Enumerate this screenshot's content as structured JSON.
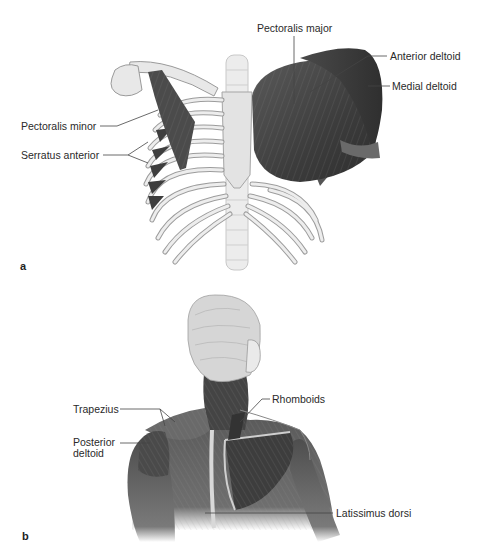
{
  "figure": {
    "panels": [
      {
        "id": "a",
        "letter": "a",
        "view": "anterior chest",
        "labels": {
          "pectoralis_major": "Pectoralis major",
          "anterior_deltoid": "Anterior deltoid",
          "medial_deltoid": "Medial deltoid",
          "pectoralis_minor": "Pectoralis minor",
          "serratus_anterior": "Serratus anterior"
        }
      },
      {
        "id": "b",
        "letter": "b",
        "view": "posterior upper back",
        "labels": {
          "trapezius": "Trapezius",
          "rhomboids": "Rhomboids",
          "posterior_deltoid_line1": "Posterior",
          "posterior_deltoid_line2": "deltoid",
          "latissimus_dorsi": "Latissimus dorsi"
        }
      }
    ],
    "colors": {
      "bone": "#e6e6e6",
      "bone_edge": "#9a9a9a",
      "muscle": "#4a4a4a",
      "muscle_light": "#7a7a7a",
      "leader_line": "#444444",
      "hair": "#cfcfcf"
    }
  }
}
